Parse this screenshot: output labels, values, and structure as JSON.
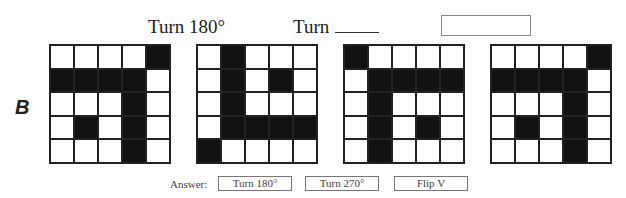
{
  "header": {
    "label1": "Turn 180°",
    "label2": "Turn",
    "label2_blank": "____",
    "label3_box": ""
  },
  "row_letter": "B",
  "grids": [
    {
      "name": "original",
      "cells": [
        [
          0,
          0,
          0,
          0,
          1
        ],
        [
          1,
          1,
          1,
          1,
          0
        ],
        [
          0,
          0,
          0,
          1,
          0
        ],
        [
          0,
          1,
          0,
          1,
          0
        ],
        [
          0,
          0,
          0,
          1,
          0
        ]
      ]
    },
    {
      "name": "turn-180",
      "cells": [
        [
          0,
          1,
          0,
          0,
          0
        ],
        [
          0,
          1,
          0,
          1,
          0
        ],
        [
          0,
          1,
          0,
          0,
          0
        ],
        [
          0,
          1,
          1,
          1,
          1
        ],
        [
          1,
          0,
          0,
          0,
          0
        ]
      ]
    },
    {
      "name": "turn-unknown",
      "cells": [
        [
          1,
          0,
          0,
          0,
          0
        ],
        [
          0,
          1,
          1,
          1,
          1
        ],
        [
          0,
          1,
          0,
          0,
          0
        ],
        [
          0,
          1,
          0,
          1,
          0
        ],
        [
          0,
          1,
          0,
          0,
          0
        ]
      ]
    },
    {
      "name": "blank-transform",
      "cells": [
        [
          0,
          0,
          0,
          0,
          1
        ],
        [
          1,
          1,
          1,
          1,
          0
        ],
        [
          0,
          0,
          0,
          1,
          0
        ],
        [
          0,
          1,
          0,
          1,
          0
        ],
        [
          0,
          0,
          0,
          1,
          0
        ]
      ]
    }
  ],
  "answer": {
    "label": "Answer:",
    "options": [
      "Turn 180°",
      "Turn 270°",
      "Flip V"
    ]
  }
}
